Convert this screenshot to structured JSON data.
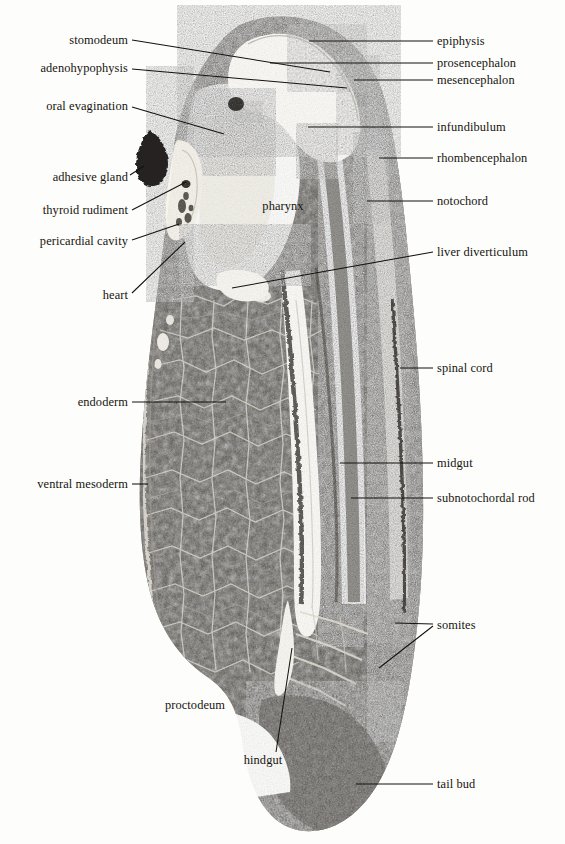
{
  "figure": {
    "kind": "histological-section-plate",
    "background_color": "#fdfdfb",
    "ink_color": "#14120e",
    "tissue_dark": "#33302c",
    "tissue_mid": "#6b665f",
    "tissue_light": "#efece4"
  },
  "labels": {
    "left": [
      {
        "text": "stomodeum",
        "x": 128,
        "y": 40,
        "leader": "M132,40 L330,72"
      },
      {
        "text": "adenohypophysis",
        "x": 128,
        "y": 68,
        "leader": "M132,69 L347,88"
      },
      {
        "text": "oral evagination",
        "x": 128,
        "y": 106,
        "leader": "M132,107 L224,134"
      },
      {
        "text": "adhesive gland",
        "x": 128,
        "y": 177,
        "leader": "M130,175 L144,166"
      },
      {
        "text": "thyroid rudiment",
        "x": 128,
        "y": 210,
        "leader": "M132,210 L186,182"
      },
      {
        "text": "pericardial cavity",
        "x": 128,
        "y": 241,
        "leader": "M132,240 L179,224"
      },
      {
        "text": "heart",
        "x": 128,
        "y": 295,
        "leader": "M132,293 L185,242"
      },
      {
        "text": "endoderm",
        "x": 128,
        "y": 402,
        "leader": "M132,402 L226,402"
      },
      {
        "text": "ventral mesoderm",
        "x": 128,
        "y": 484,
        "leader": "M132,484 L148,484"
      }
    ],
    "right": [
      {
        "text": "epiphysis",
        "x": 437,
        "y": 41,
        "leader": "M433,41 L309,41"
      },
      {
        "text": "prosencephalon",
        "x": 437,
        "y": 63,
        "leader": "M433,63 L270,63"
      },
      {
        "text": "mesencephalon",
        "x": 437,
        "y": 80,
        "leader": "M433,80 L354,80"
      },
      {
        "text": "infundibulum",
        "x": 437,
        "y": 127,
        "leader": "M433,127 L308,127"
      },
      {
        "text": "rhombencephalon",
        "x": 437,
        "y": 158,
        "leader": "M433,158 L379,158"
      },
      {
        "text": "notochord",
        "x": 437,
        "y": 201,
        "leader": "M433,201 L367,201"
      },
      {
        "text": "liver diverticulum",
        "x": 437,
        "y": 252,
        "leader": "M433,252 L232,288"
      },
      {
        "text": "spinal cord",
        "x": 437,
        "y": 368,
        "leader": "M433,368 L400,368"
      },
      {
        "text": "midgut",
        "x": 437,
        "y": 463,
        "leader": "M433,463 L340,463"
      },
      {
        "text": "subnotochordal rod",
        "x": 437,
        "y": 498,
        "leader": "M433,498 L351,498"
      },
      {
        "text": "somites",
        "x": 437,
        "y": 625,
        "leader": "M433,624 L395,623 M433,626 L379,668"
      },
      {
        "text": "tail bud",
        "x": 437,
        "y": 784,
        "leader": "M433,784 L356,784"
      }
    ],
    "free": [
      {
        "text": "pharynx",
        "x": 283,
        "y": 206
      },
      {
        "text": "proctodeum",
        "x": 195,
        "y": 705
      },
      {
        "text": "hindgut",
        "x": 263,
        "y": 760,
        "leader": "M276,752 L292,648"
      }
    ]
  }
}
